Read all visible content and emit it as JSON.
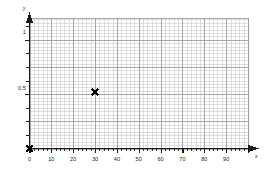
{
  "chart_data": {
    "type": "scatter",
    "title": "",
    "xlabel": "x",
    "ylabel": "y",
    "xlim": [
      0,
      100
    ],
    "ylim": [
      0,
      1.2
    ],
    "grid": true,
    "grid_minor": true,
    "legend": "none",
    "x_ticks": [
      0,
      10,
      20,
      30,
      40,
      50,
      60,
      70,
      80,
      90
    ],
    "x_tick_labels": [
      "0",
      "10",
      "20",
      "30",
      "40",
      "50",
      "60",
      "70",
      "80",
      "90"
    ],
    "y_ticks": [
      0.5,
      1
    ],
    "y_tick_labels": [
      "0.5",
      "1"
    ],
    "y_minor_tick_step": 0.125,
    "x_minor_tick_step": 2,
    "points": [
      {
        "x": 0,
        "y": 0,
        "marker": "x",
        "color": "#000000"
      },
      {
        "x": 30,
        "y": 0.52,
        "marker": "x",
        "color": "#000000"
      }
    ],
    "series": [
      {
        "name": "data",
        "marker": "x",
        "color": "#000000",
        "x": [
          0,
          30
        ],
        "values": [
          0,
          0.52
        ]
      }
    ]
  },
  "axes": {
    "x_axis_label": "x",
    "y_axis_label": "y",
    "x_arrow": true,
    "y_arrow": true
  },
  "colors": {
    "axis": "#1a1a1a",
    "grid_major": "#9a9a9a",
    "grid_minor": "#c9c9c9",
    "marker": "#000000",
    "background": "#ffffff"
  }
}
